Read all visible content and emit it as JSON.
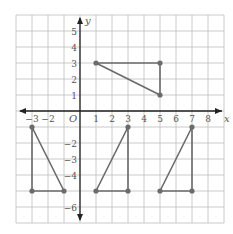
{
  "figure": {
    "axis_labels": {
      "x": "x",
      "y": "y",
      "origin": "O"
    },
    "x_ticks": [
      {
        "value": -3,
        "label": "−3"
      },
      {
        "value": -2,
        "label": "−2"
      },
      {
        "value": 1,
        "label": "1"
      },
      {
        "value": 2,
        "label": "2"
      },
      {
        "value": 3,
        "label": "3"
      },
      {
        "value": 4,
        "label": "4"
      },
      {
        "value": 5,
        "label": "5"
      },
      {
        "value": 6,
        "label": "6"
      },
      {
        "value": 7,
        "label": "7"
      },
      {
        "value": 8,
        "label": "8"
      }
    ],
    "y_ticks": [
      {
        "value": 5,
        "label": "5"
      },
      {
        "value": 4,
        "label": "4"
      },
      {
        "value": 3,
        "label": "3"
      },
      {
        "value": 2,
        "label": "2"
      },
      {
        "value": 1,
        "label": "1"
      },
      {
        "value": -2,
        "label": "−2"
      },
      {
        "value": -3,
        "label": "−3"
      },
      {
        "value": -4,
        "label": "−4"
      },
      {
        "value": -6,
        "label": "−6"
      }
    ],
    "grid": {
      "x_min": -4,
      "x_max": 9,
      "y_min": -7,
      "y_max": 6
    },
    "colors": {
      "grid": "#bdbdbd",
      "axis": "#222222",
      "shape": "#6b6b6b",
      "label": "#555555"
    },
    "triangles": [
      {
        "name": "triangle-a",
        "vertices": [
          [
            1,
            3
          ],
          [
            5,
            3
          ],
          [
            5,
            1
          ]
        ]
      },
      {
        "name": "triangle-b",
        "vertices": [
          [
            -3,
            -1
          ],
          [
            -3,
            -5
          ],
          [
            -1,
            -5
          ]
        ]
      },
      {
        "name": "triangle-c",
        "vertices": [
          [
            3,
            -1
          ],
          [
            3,
            -5
          ],
          [
            1,
            -5
          ]
        ]
      },
      {
        "name": "triangle-d",
        "vertices": [
          [
            7,
            -1
          ],
          [
            7,
            -5
          ],
          [
            5,
            -5
          ]
        ]
      }
    ]
  }
}
